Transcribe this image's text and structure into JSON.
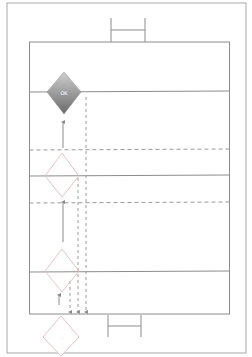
{
  "diagram": {
    "type": "swimlane-flow",
    "colors": {
      "background": "#ffffff",
      "frame": "#9a9a9a",
      "lane_line": "#8c8c8c",
      "dashed_line": "#a0a0a0",
      "diamond_filled_top": "#c8c8c8",
      "diamond_filled_bottom": "#6e6e6e",
      "diamond_outline": "#e0c8c8",
      "arrow": "#9a9a9a",
      "label_light": "#ffffff",
      "label_faint": "#d8d8d8"
    },
    "nodes": [
      {
        "id": "decision-top",
        "shape": "diamond",
        "style": "filled",
        "label": "OK"
      },
      {
        "id": "decision-middle",
        "shape": "diamond",
        "style": "outline",
        "label": ""
      },
      {
        "id": "decision-lower",
        "shape": "diamond",
        "style": "outline",
        "label": ""
      },
      {
        "id": "decision-bottom",
        "shape": "diamond",
        "style": "outline",
        "label": "..."
      }
    ],
    "lanes": [
      {
        "id": "lane-1",
        "boundary": "solid"
      },
      {
        "id": "lane-2",
        "boundary": "solid"
      },
      {
        "id": "lane-3",
        "boundary": "solid"
      },
      {
        "id": "lane-4",
        "boundary": "solid"
      }
    ],
    "connectors": [
      {
        "from": "decision-middle",
        "to": "decision-top",
        "style": "solid",
        "direction": "up"
      },
      {
        "from": "decision-lower",
        "to": "decision-middle",
        "style": "solid",
        "direction": "up"
      },
      {
        "from": "bottom-edge",
        "to": "decision-lower",
        "style": "solid",
        "direction": "up"
      },
      {
        "from": "decision-top",
        "to": "bottom-edge",
        "style": "dashed",
        "direction": "down"
      },
      {
        "from": "decision-middle",
        "to": "bottom-edge",
        "style": "dashed",
        "direction": "down"
      },
      {
        "from": "decision-lower",
        "to": "bottom-edge",
        "style": "dashed",
        "direction": "down"
      }
    ]
  }
}
